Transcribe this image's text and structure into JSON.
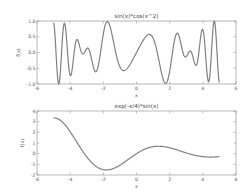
{
  "chart_data": [
    {
      "type": "line",
      "title": "sin(x)*cos(x^2)",
      "xlabel": "x",
      "ylabel": "f(x)",
      "xlim": [
        -6,
        6
      ],
      "ylim": [
        -1.0,
        1.0
      ],
      "xticks": [
        "-6",
        "-4",
        "-2",
        "0",
        "2",
        "4",
        "6"
      ],
      "yticks": [
        "1.0",
        "0.5",
        "0.0",
        "-0.5",
        "-1.0"
      ],
      "grid": false,
      "line_color": "#808080",
      "series": [
        {
          "name": "sin(x)*cos(x^2)",
          "x": [
            -5.0,
            -4.95,
            -4.9,
            -4.85,
            -4.8,
            -4.75,
            -4.7,
            -4.65,
            -4.6,
            -4.55,
            -4.5,
            -4.45,
            -4.4,
            -4.35,
            -4.3,
            -4.25,
            -4.2,
            -4.15,
            -4.1,
            -4.05,
            -4.0,
            -3.95,
            -3.9,
            -3.85,
            -3.8,
            -3.75,
            -3.7,
            -3.65,
            -3.6,
            -3.55,
            -3.5,
            -3.45,
            -3.4,
            -3.35,
            -3.3,
            -3.25,
            -3.2,
            -3.15,
            -3.1,
            -3.05,
            -3.0,
            -2.95,
            -2.9,
            -2.85,
            -2.8,
            -2.75,
            -2.7,
            -2.65,
            -2.6,
            -2.55,
            -2.5,
            -2.45,
            -2.4,
            -2.35,
            -2.3,
            -2.25,
            -2.2,
            -2.15,
            -2.1,
            -2.05,
            -2.0,
            -1.95,
            -1.9,
            -1.85,
            -1.8,
            -1.75,
            -1.7,
            -1.65,
            -1.6,
            -1.55,
            -1.5,
            -1.45,
            -1.4,
            -1.35,
            -1.3,
            -1.25,
            -1.2,
            -1.15,
            -1.1,
            -1.05,
            -1.0,
            -0.95,
            -0.9,
            -0.85,
            -0.8,
            -0.75,
            -0.7,
            -0.65,
            -0.6,
            -0.55,
            -0.5,
            -0.45,
            -0.4,
            -0.35,
            -0.3,
            -0.25,
            -0.2,
            -0.15,
            -0.1,
            -0.05,
            0.0,
            0.05,
            0.1,
            0.15,
            0.2,
            0.25,
            0.3,
            0.35,
            0.4,
            0.45,
            0.5,
            0.55,
            0.6,
            0.65,
            0.7,
            0.75,
            0.8,
            0.85,
            0.9,
            0.95,
            1.0,
            1.05,
            1.1,
            1.15,
            1.2,
            1.25,
            1.3,
            1.35,
            1.4,
            1.45,
            1.5,
            1.55,
            1.6,
            1.65,
            1.7,
            1.75,
            1.8,
            1.85,
            1.9,
            1.95,
            2.0,
            2.05,
            2.1,
            2.15,
            2.2,
            2.25,
            2.3,
            2.35,
            2.4,
            2.45,
            2.5,
            2.55,
            2.6,
            2.65,
            2.7,
            2.75,
            2.8,
            2.85,
            2.9,
            2.95,
            3.0,
            3.05,
            3.1,
            3.15,
            3.2,
            3.25,
            3.3,
            3.35,
            3.4,
            3.45,
            3.5,
            3.55,
            3.6,
            3.65,
            3.7,
            3.75,
            3.8,
            3.85,
            3.9,
            3.95,
            4.0,
            4.05,
            4.1,
            4.15,
            4.2,
            4.25,
            4.3,
            4.35,
            4.4,
            4.45,
            4.5,
            4.55,
            4.6,
            4.65,
            4.7,
            4.75,
            4.8,
            4.85,
            4.9,
            4.95,
            5.0
          ],
          "function": "sin(x)*cos(x^2)"
        }
      ]
    },
    {
      "type": "line",
      "title": "exp(-x/4)*sin(x)",
      "xlabel": "x",
      "ylabel": "f(x)",
      "xlim": [
        -6,
        6
      ],
      "ylim": [
        -2,
        4
      ],
      "xticks": [
        "-6",
        "-4",
        "-2",
        "0",
        "2",
        "4",
        "6"
      ],
      "yticks": [
        "4",
        "3",
        "2",
        "1",
        "0",
        "-1",
        "-2"
      ],
      "grid": false,
      "line_color": "#808080",
      "series": [
        {
          "name": "exp(-x/4)*sin(x)",
          "x_range": [
            -5.0,
            5.0
          ],
          "samples": 201,
          "function": "exp(-x/4)*sin(x)",
          "key_points": [
            {
              "x": -5.0,
              "y": 3.33
            },
            {
              "x": -4.0,
              "y": 2.06
            },
            {
              "x": -2.0,
              "y": -1.5
            },
            {
              "x": -1.8,
              "y": -1.53
            },
            {
              "x": 0.0,
              "y": 0.0
            },
            {
              "x": 1.4,
              "y": 0.7
            },
            {
              "x": 2.0,
              "y": 0.55
            },
            {
              "x": 4.0,
              "y": -0.28
            },
            {
              "x": 4.6,
              "y": -0.31
            },
            {
              "x": 5.0,
              "y": -0.27
            }
          ]
        }
      ]
    }
  ]
}
